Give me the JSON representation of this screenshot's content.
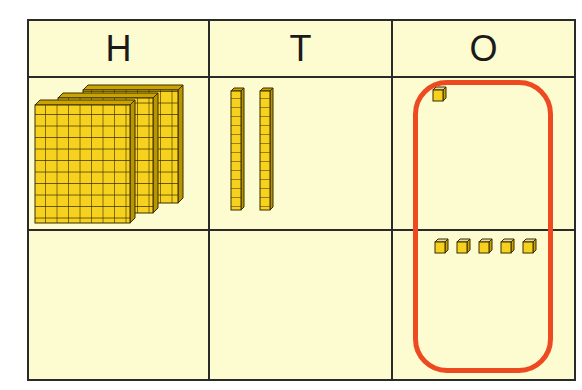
{
  "table": {
    "headers": [
      "H",
      "T",
      "O"
    ],
    "rows": [
      {
        "hundreds": 3,
        "tens": 2,
        "ones": 1
      },
      {
        "hundreds": 0,
        "tens": 0,
        "ones": 5
      }
    ]
  },
  "colors": {
    "background": "#fdfbd0",
    "block": "#f6d21f",
    "grid_line": "#2a2a2a",
    "highlight_loop": "#ee4a22"
  },
  "highlight": {
    "column": "O",
    "shape": "rounded-rectangle",
    "spans_rows": [
      1,
      2
    ]
  }
}
